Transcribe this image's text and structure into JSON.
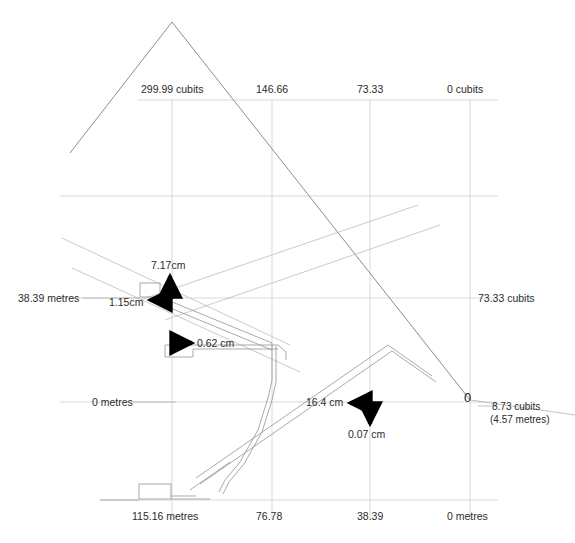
{
  "diagram": {
    "colors": {
      "grid": "#c9c9c9",
      "outline": "#808080",
      "structure": "#9a9a9a",
      "arrow": "#000000",
      "text": "#2b2b2b"
    },
    "top_scale": {
      "unit": "cubits",
      "ticks": [
        {
          "label": "299.99 cubits",
          "x": 172
        },
        {
          "label": "146.66",
          "x": 272
        },
        {
          "label": "73.33",
          "x": 370
        },
        {
          "label": "0 cubits",
          "x": 470
        }
      ]
    },
    "bottom_scale": {
      "unit": "metres",
      "ticks": [
        {
          "label": "115.16 metres",
          "x": 172
        },
        {
          "label": "76.78",
          "x": 272
        },
        {
          "label": "38.39",
          "x": 370
        },
        {
          "label": "0 metres",
          "x": 470
        }
      ]
    },
    "left_scale": {
      "unit": "metres",
      "ticks": [
        {
          "label": "38.39 metres",
          "y": 298
        },
        {
          "label": "0 metres",
          "y": 402
        }
      ]
    },
    "right_scale": {
      "unit": "cubits",
      "ticks": [
        {
          "label": "73.33 cubits",
          "y": 298
        }
      ]
    },
    "origin": {
      "marker": "0",
      "primary": "8.73 cubits",
      "secondary": "(4.57 metres)"
    },
    "annotations": [
      {
        "id": "up-vertical",
        "label": "7.17cm",
        "direction": "up"
      },
      {
        "id": "left-upper",
        "label": "1.15cm",
        "direction": "left"
      },
      {
        "id": "right-gallery",
        "label": "0.62 cm",
        "direction": "right"
      },
      {
        "id": "left-lower",
        "label": "16.4 cm",
        "direction": "left"
      },
      {
        "id": "down-lower",
        "label": "0.07 cm",
        "direction": "down"
      }
    ]
  }
}
